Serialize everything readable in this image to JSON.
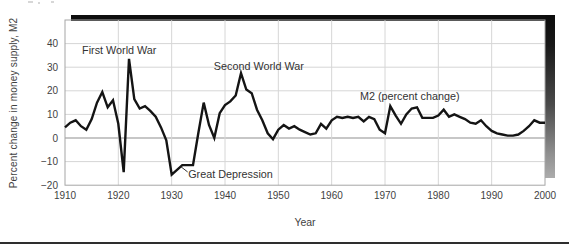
{
  "chart_data": {
    "type": "line",
    "title": "",
    "xlabel": "Year",
    "ylabel": "Percent change in money supply, M2",
    "xlim": [
      1910,
      2000
    ],
    "ylim": [
      -20,
      50
    ],
    "x_ticks": [
      1910,
      1920,
      1930,
      1940,
      1950,
      1960,
      1970,
      1980,
      1990,
      2000
    ],
    "y_ticks": [
      40,
      30,
      20,
      10,
      0,
      -10,
      -20
    ],
    "grid": true,
    "legend_position": "none",
    "line_color": "#141414",
    "grid_color": "#d6d6d6",
    "zero_line_color": "#8f8f8f",
    "border_color": "#a6a6a6",
    "tick_color": "#3f3f3f",
    "annotation_color": "#333333",
    "series": [
      {
        "name": "M2 (percent change)",
        "x": [
          1910,
          1911,
          1912,
          1913,
          1914,
          1915,
          1916,
          1917,
          1918,
          1919,
          1920,
          1921,
          1922,
          1923,
          1924,
          1925,
          1926,
          1927,
          1928,
          1929,
          1930,
          1931,
          1932,
          1933,
          1934,
          1935,
          1936,
          1937,
          1938,
          1939,
          1940,
          1941,
          1942,
          1943,
          1944,
          1945,
          1946,
          1947,
          1948,
          1949,
          1950,
          1951,
          1952,
          1953,
          1954,
          1955,
          1956,
          1957,
          1958,
          1959,
          1960,
          1961,
          1962,
          1963,
          1964,
          1965,
          1966,
          1967,
          1968,
          1969,
          1970,
          1971,
          1972,
          1973,
          1974,
          1975,
          1976,
          1977,
          1978,
          1979,
          1980,
          1981,
          1982,
          1983,
          1984,
          1985,
          1986,
          1987,
          1988,
          1989,
          1990,
          1991,
          1992,
          1993,
          1994,
          1995,
          1996,
          1997,
          1998,
          1999,
          2000
        ],
        "values": [
          4.5,
          6.5,
          7.5,
          5,
          3.5,
          8,
          15,
          19.5,
          13,
          16,
          6,
          -14.5,
          33.5,
          16.5,
          12.5,
          13.5,
          11.5,
          9,
          4.5,
          -1,
          -15.5,
          -13.5,
          -11.5,
          -11.5,
          -11.5,
          2,
          15,
          5.5,
          0,
          10.5,
          14,
          15.5,
          18,
          27.5,
          20.5,
          19,
          12,
          7.5,
          2,
          -0.5,
          3.5,
          5.5,
          4,
          5,
          3.5,
          2.5,
          1.5,
          2,
          6,
          4,
          7.5,
          9,
          8.5,
          9,
          8.5,
          9,
          7,
          9,
          8,
          3.5,
          2,
          13.5,
          9.5,
          6,
          10,
          12.5,
          13,
          8.5,
          8.5,
          8.5,
          9.5,
          12,
          9,
          10,
          9,
          8,
          6.5,
          6,
          7.5,
          5,
          3,
          2,
          1.5,
          1,
          1,
          1.5,
          3,
          5,
          7.5,
          6.5,
          6.5
        ]
      }
    ],
    "annotations": [
      {
        "text": "First World War",
        "x": 1913.2,
        "y": 37.1,
        "align": "left"
      },
      {
        "text": "Second World War",
        "x": 1937.9,
        "y": 30.5,
        "align": "left"
      },
      {
        "text": "M2 (percent change)",
        "x": 1965.3,
        "y": 17.8,
        "align": "left"
      },
      {
        "text": "Great Depression",
        "x": 1933.1,
        "y": -15.3,
        "align": "left",
        "leader": {
          "x1": 1931.7,
          "y1": -12.1,
          "x2": 1933.0,
          "y2": -14.4
        }
      }
    ]
  }
}
